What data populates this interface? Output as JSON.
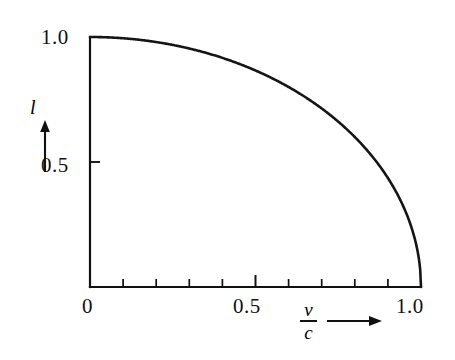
{
  "figure": {
    "background_color": "#ffffff",
    "ink_color": "#111111"
  },
  "axes": {
    "y_tick_labels": [
      "1.0",
      "0.5"
    ],
    "x_tick_labels": [
      "0",
      "0.5",
      "1.0"
    ],
    "y_axis_title": "l",
    "x_axis_title_numerator": "v",
    "x_axis_title_denominator": "c",
    "y_arrow": "up-arrow",
    "x_arrow": "right-arrow"
  },
  "chart_data": {
    "type": "line",
    "title": "",
    "subtitle": "",
    "xlabel": "v/c",
    "ylabel": "l",
    "xlim": [
      0,
      1
    ],
    "ylim": [
      0,
      1
    ],
    "grid": false,
    "legend": null,
    "x_ticks": [
      0,
      0.1,
      0.2,
      0.3,
      0.4,
      0.5,
      0.6,
      0.7,
      0.8,
      0.9,
      1.0
    ],
    "x_ticks_labeled": [
      0,
      0.5,
      1.0
    ],
    "y_ticks": [
      0.5,
      1.0
    ],
    "y_ticks_labeled": [
      0.5,
      1.0
    ],
    "annotations": [],
    "series": [
      {
        "name": "length contraction",
        "equation": "l = sqrt(1 - (v/c)^2)",
        "x": [
          0,
          0.05,
          0.1,
          0.15,
          0.2,
          0.25,
          0.3,
          0.35,
          0.4,
          0.45,
          0.5,
          0.55,
          0.6,
          0.65,
          0.7,
          0.75,
          0.8,
          0.85,
          0.9,
          0.92,
          0.94,
          0.96,
          0.97,
          0.98,
          0.99,
          0.995,
          0.999,
          1.0
        ],
        "values": [
          1.0,
          0.999,
          0.995,
          0.989,
          0.98,
          0.968,
          0.954,
          0.937,
          0.917,
          0.893,
          0.866,
          0.835,
          0.8,
          0.76,
          0.714,
          0.661,
          0.6,
          0.527,
          0.436,
          0.392,
          0.341,
          0.28,
          0.243,
          0.199,
          0.141,
          0.1,
          0.045,
          0.0
        ]
      }
    ]
  }
}
